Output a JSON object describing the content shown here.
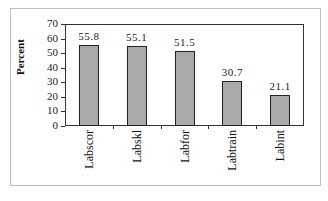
{
  "chart_data": {
    "type": "bar",
    "title": "",
    "xlabel": "",
    "ylabel": "Percent",
    "ylim": [
      0,
      70
    ],
    "yticks": [
      0,
      10,
      20,
      30,
      40,
      50,
      60,
      70
    ],
    "categories": [
      "Labscor",
      "Labskl",
      "Labfor",
      "Labtrain",
      "Labint"
    ],
    "values": [
      55.8,
      55.1,
      51.5,
      30.7,
      21.1
    ],
    "value_labels": [
      "55.8",
      "55.1",
      "51.5",
      "30.7",
      "21.1"
    ],
    "bar_color": "#a9a9a9",
    "grid": false,
    "legend": null
  }
}
